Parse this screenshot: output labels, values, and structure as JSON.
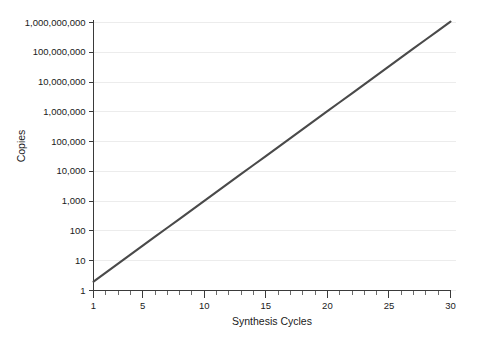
{
  "chart_data": {
    "type": "line",
    "title": "",
    "xlabel": "Synthesis Cycles",
    "ylabel": "Copies",
    "xlim": [
      1,
      30
    ],
    "ylim": [
      1,
      1000000000
    ],
    "yscale": "log",
    "xscale": "linear",
    "grid": "horizontal",
    "legend": "none",
    "line_color": "#4a4a4a",
    "gridline_color": "#ececec",
    "axis_color": "#3a3a3a",
    "background_color": "#ffffff",
    "text_color": "#1a1a1a",
    "y_tick_labels": [
      "1",
      "10",
      "100",
      "1,000",
      "10,000",
      "100,000",
      "1,000,000",
      "10,000,000",
      "100,000,000",
      "1,000,000,000"
    ],
    "y_tick_values": [
      1,
      10,
      100,
      1000,
      10000,
      100000,
      1000000,
      10000000,
      100000000,
      1000000000
    ],
    "x_tick_labels": [
      "1",
      "5",
      "10",
      "15",
      "20",
      "25",
      "30"
    ],
    "x_tick_values": [
      1,
      5,
      10,
      15,
      20,
      25,
      30
    ],
    "x_minor_ticks": [
      1,
      2,
      3,
      4,
      5,
      6,
      7,
      8,
      9,
      10,
      11,
      12,
      13,
      14,
      15,
      16,
      17,
      18,
      19,
      20,
      21,
      22,
      23,
      24,
      25,
      26,
      27,
      28,
      29,
      30
    ],
    "series": [
      {
        "name": "Copies",
        "x": [
          1,
          2,
          3,
          4,
          5,
          6,
          7,
          8,
          9,
          10,
          11,
          12,
          13,
          14,
          15,
          16,
          17,
          18,
          19,
          20,
          21,
          22,
          23,
          24,
          25,
          26,
          27,
          28,
          29,
          30
        ],
        "values": [
          2,
          4,
          8,
          16,
          32,
          64,
          128,
          256,
          512,
          1024,
          2048,
          4096,
          8192,
          16384,
          32768,
          65536,
          131072,
          262144,
          524288,
          1048576,
          2097152,
          4194304,
          8388608,
          16777216,
          33554432,
          67108864,
          134217728,
          268435456,
          536870912,
          1073741824
        ]
      }
    ]
  }
}
